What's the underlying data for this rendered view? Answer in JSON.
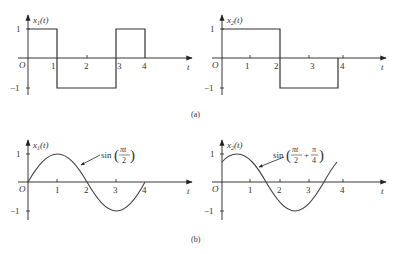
{
  "figure": {
    "caption_a": "(a)",
    "caption_b": "(b)"
  },
  "panels": [
    {
      "id": "a-left",
      "y_label": "x",
      "y_label_sub": "1",
      "y_label_suffix": "(t)",
      "x_label": "t",
      "origin": "O",
      "x_ticks": [
        "1",
        "2",
        "3",
        "4"
      ],
      "y_ticks": [
        "1",
        "−1"
      ],
      "waveform": "square",
      "segments": [
        [
          0,
          1,
          1
        ],
        [
          1,
          3,
          -1
        ],
        [
          3,
          4,
          1
        ]
      ]
    },
    {
      "id": "a-right",
      "y_label": "x",
      "y_label_sub": "2",
      "y_label_suffix": "(t)",
      "x_label": "t",
      "origin": "O",
      "x_ticks": [
        "1",
        "2",
        "3",
        "4"
      ],
      "y_ticks": [
        "1",
        "−1"
      ],
      "waveform": "square",
      "segments": [
        [
          0,
          2,
          1
        ],
        [
          2,
          4,
          -1
        ]
      ]
    },
    {
      "id": "b-left",
      "y_label": "x",
      "y_label_sub": "1",
      "y_label_suffix": "(t)",
      "x_label": "t",
      "origin": "O",
      "x_ticks": [
        "1",
        "2",
        "3",
        "4"
      ],
      "y_ticks": [
        "1",
        "−1"
      ],
      "waveform": "sine",
      "annotation": {
        "fn": "sin",
        "num": "πt",
        "den": "2"
      }
    },
    {
      "id": "b-right",
      "y_label": "x",
      "y_label_sub": "2",
      "y_label_suffix": "(t)",
      "x_label": "t",
      "origin": "O",
      "x_ticks": [
        "1",
        "2",
        "3",
        "4"
      ],
      "y_ticks": [
        "1",
        "−1"
      ],
      "waveform": "sine",
      "annotation": {
        "fn": "sin",
        "num1": "πt",
        "den1": "2",
        "plus": "+",
        "num2": "π",
        "den2": "4"
      }
    }
  ]
}
